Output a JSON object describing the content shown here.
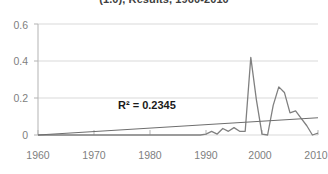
{
  "chart_data": {
    "type": "line",
    "title": "(1.0), Results, 1960-2010",
    "xlabel": "",
    "ylabel": "",
    "xlim": [
      1960,
      2010
    ],
    "ylim": [
      0,
      0.6
    ],
    "grid": true,
    "legend": false,
    "annotations": [
      {
        "name": "r-squared",
        "text": "R² = 0.2345",
        "x": 1985,
        "y": 0.17
      }
    ],
    "yticks": [
      "0",
      "0.2",
      "0.4",
      "0.6"
    ],
    "ytick_values": [
      0,
      0.2,
      0.4,
      0.6
    ],
    "xticks": [
      "1960",
      "1970",
      "1980",
      "1990",
      "2000",
      "2010"
    ],
    "xtick_values": [
      1960,
      1970,
      1980,
      1990,
      2000,
      2010
    ],
    "series": [
      {
        "name": "observed",
        "color": "#808080",
        "x": [
          1960,
          1961,
          1962,
          1963,
          1964,
          1965,
          1966,
          1967,
          1968,
          1969,
          1970,
          1971,
          1972,
          1973,
          1974,
          1975,
          1976,
          1977,
          1978,
          1979,
          1980,
          1981,
          1982,
          1983,
          1984,
          1985,
          1986,
          1987,
          1988,
          1989,
          1990,
          1991,
          1992,
          1993,
          1994,
          1995,
          1996,
          1997,
          1998,
          1999,
          2000,
          2001,
          2002,
          2003,
          2004,
          2005,
          2006,
          2007,
          2008,
          2009,
          2010
        ],
        "values": [
          0,
          0,
          0,
          0,
          0,
          0,
          0,
          0,
          0,
          0,
          0,
          0,
          0,
          0,
          0,
          0,
          0,
          0,
          0,
          0,
          0,
          0,
          0,
          0,
          0,
          0,
          0,
          0,
          0,
          0,
          0.005,
          0.02,
          0.005,
          0.035,
          0.02,
          0.04,
          0.02,
          0.02,
          0.42,
          0.19,
          0.005,
          0.0,
          0.16,
          0.26,
          0.23,
          0.12,
          0.13,
          0.09,
          0.05,
          0.0,
          0.01
        ]
      },
      {
        "name": "linear-trendline",
        "color": "#6e6e6e",
        "x": [
          1960,
          2010
        ],
        "values": [
          0.0,
          0.093
        ]
      }
    ]
  }
}
